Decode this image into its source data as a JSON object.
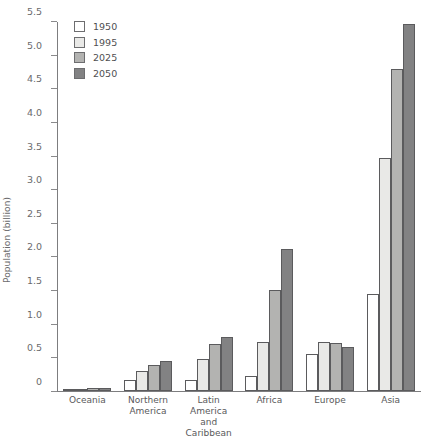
{
  "chart_data": {
    "type": "bar",
    "title": "",
    "xlabel": "",
    "ylabel": "Population (billion)",
    "ylim": [
      0,
      5.5
    ],
    "grid": false,
    "legend_position": "top-left",
    "categories": [
      "Oceania",
      "Northern\nAmerica",
      "Latin America\nand Caribbean",
      "Africa",
      "Europe",
      "Asia"
    ],
    "ytick_labels": [
      "0",
      "0.5",
      "1.0",
      "1.5",
      "2.0",
      "2.5",
      "3.0",
      "3.5",
      "4.0",
      "4.5",
      "5.0",
      "5.5"
    ],
    "yticks": [
      0,
      0.5,
      1.0,
      1.5,
      2.0,
      2.5,
      3.0,
      3.5,
      4.0,
      4.5,
      5.0,
      5.5
    ],
    "series": [
      {
        "name": "1950",
        "color": "#ffffff",
        "values": [
          0.013,
          0.17,
          0.17,
          0.22,
          0.55,
          1.45
        ]
      },
      {
        "name": "1995",
        "color": "#e9e9e7",
        "values": [
          0.028,
          0.3,
          0.48,
          0.73,
          0.73,
          3.48
        ]
      },
      {
        "name": "2025",
        "color": "#b3b3b1",
        "values": [
          0.041,
          0.39,
          0.7,
          1.5,
          0.72,
          4.8
        ]
      },
      {
        "name": "2050",
        "color": "#828283",
        "values": [
          0.046,
          0.44,
          0.81,
          2.12,
          0.66,
          5.47
        ]
      }
    ]
  }
}
